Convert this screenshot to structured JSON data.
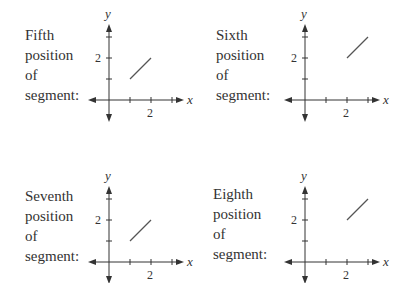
{
  "panels": [
    {
      "label_lines": [
        "Fifth",
        "position",
        "of",
        "segment:"
      ],
      "axis": {
        "x_label": "x",
        "y_label": "y",
        "x_tick_label": "2",
        "y_tick_label": "2"
      },
      "segment": {
        "from": [
          1,
          1
        ],
        "to": [
          2,
          2
        ]
      }
    },
    {
      "label_lines": [
        "Sixth",
        "position",
        "of",
        "segment:"
      ],
      "axis": {
        "x_label": "x",
        "y_label": "y",
        "x_tick_label": "2",
        "y_tick_label": "2"
      },
      "segment": {
        "from": [
          2,
          2
        ],
        "to": [
          3,
          3
        ]
      }
    },
    {
      "label_lines": [
        "Seventh",
        "position",
        "of",
        "segment:"
      ],
      "axis": {
        "x_label": "x",
        "y_label": "y",
        "x_tick_label": "2",
        "y_tick_label": "2"
      },
      "segment": {
        "from": [
          1,
          1
        ],
        "to": [
          2,
          2
        ]
      }
    },
    {
      "label_lines": [
        "Eighth",
        "position",
        "of",
        "segment:"
      ],
      "axis": {
        "x_label": "x",
        "y_label": "y",
        "x_tick_label": "2",
        "y_tick_label": "2"
      },
      "segment": {
        "from": [
          2,
          2
        ],
        "to": [
          3,
          3
        ]
      }
    }
  ],
  "colors": {
    "axis": "#333333",
    "segment": "#555555",
    "text": "#333333"
  }
}
